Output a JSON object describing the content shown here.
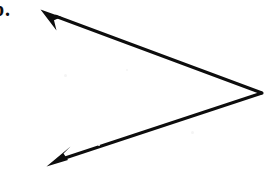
{
  "figure": {
    "label": "b.",
    "background_color": "#ffffff",
    "ink_color": "#0d0d0d",
    "stroke_width": 3,
    "vertex": {
      "x": 262,
      "y": 93
    },
    "rays": [
      {
        "name": "upper-ray",
        "from": {
          "x": 262,
          "y": 93
        },
        "to": {
          "x": 42,
          "y": 11
        },
        "arrowhead": "at-endpoint",
        "direction": "up-left"
      },
      {
        "name": "lower-ray",
        "from": {
          "x": 262,
          "y": 93
        },
        "to": {
          "x": 49,
          "y": 164
        },
        "arrowhead": "at-endpoint",
        "direction": "down-left"
      }
    ],
    "specks": [
      {
        "x": 64,
        "y": 74,
        "size": 3
      },
      {
        "x": 126,
        "y": 69,
        "size": 2
      },
      {
        "x": 191,
        "y": 131,
        "size": 3
      },
      {
        "x": 98,
        "y": 144,
        "size": 2
      }
    ]
  }
}
